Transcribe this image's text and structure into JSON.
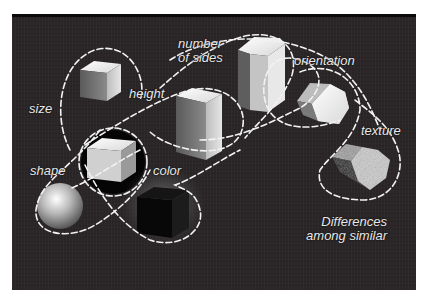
{
  "figure": {
    "labels": {
      "size": "size",
      "height": "height",
      "number_of_sides_line1": "number",
      "number_of_sides_line2": "of sides",
      "orientation": "orientation",
      "texture": "texture",
      "shape": "shape",
      "color": "color"
    },
    "caption": {
      "line1": "Differences",
      "line2": "among similar"
    },
    "objects": [
      {
        "name": "small-cube",
        "shape": "cube"
      },
      {
        "name": "reference-cube",
        "shape": "cube"
      },
      {
        "name": "tall-box",
        "shape": "rectangular prism"
      },
      {
        "name": "hexagonal-prism",
        "shape": "hexagonal prism"
      },
      {
        "name": "rotated-hexagonal-prism",
        "shape": "hexagonal prism"
      },
      {
        "name": "textured-hexagonal-prism",
        "shape": "hexagonal prism"
      },
      {
        "name": "sphere",
        "shape": "sphere"
      },
      {
        "name": "black-cube",
        "shape": "cube"
      }
    ],
    "colors": {
      "background": "#2a2627",
      "dashed_outline": "#f2f2f2",
      "label_text": "#e8e8e8"
    }
  }
}
